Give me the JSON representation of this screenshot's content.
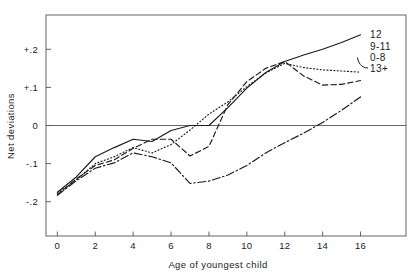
{
  "chart_data": {
    "type": "line",
    "title": "",
    "xlabel": "Age of youngest child",
    "ylabel": "Net deviations",
    "xlim": [
      -0.6,
      18.4
    ],
    "ylim": [
      -0.29,
      0.29
    ],
    "xticks": [
      0,
      2,
      4,
      6,
      8,
      10,
      12,
      14,
      16
    ],
    "xticklabels": [
      "0",
      "2",
      "4",
      "6",
      "8",
      "10",
      "12",
      "14",
      "16"
    ],
    "yticks": [
      0.2,
      0.1,
      0,
      -0.1,
      -0.2
    ],
    "yticklabels": [
      "+.2",
      "+.1",
      "0",
      "-.1",
      "-.2"
    ],
    "grid": false,
    "zero_line": true,
    "legend": "inline-right-end-labels",
    "x": [
      0,
      1,
      2,
      3,
      4,
      5,
      6,
      7,
      8,
      9,
      10,
      11,
      12,
      13,
      14,
      15,
      16
    ],
    "series": [
      {
        "name": "12",
        "label": "12",
        "style": "solid",
        "color": "#1a1a1a",
        "values": [
          -0.175,
          -0.135,
          -0.082,
          -0.058,
          -0.036,
          -0.042,
          -0.013,
          0.0,
          0.0,
          0.047,
          0.098,
          0.139,
          0.168,
          0.185,
          0.2,
          0.218,
          0.238
        ]
      },
      {
        "name": "9-11",
        "label": "9-11",
        "style": "dotted",
        "color": "#1a1a1a",
        "values": [
          -0.178,
          -0.143,
          -0.1,
          -0.082,
          -0.058,
          -0.072,
          -0.05,
          -0.012,
          0.03,
          0.062,
          0.102,
          0.138,
          0.163,
          0.152,
          0.146,
          0.143,
          0.14
        ]
      },
      {
        "name": "0-8",
        "label": "0-8",
        "style": "dashed",
        "color": "#1a1a1a",
        "values": [
          -0.182,
          -0.14,
          -0.105,
          -0.09,
          -0.06,
          -0.036,
          -0.036,
          -0.08,
          -0.055,
          0.055,
          0.115,
          0.15,
          0.168,
          0.13,
          0.106,
          0.108,
          0.118
        ]
      },
      {
        "name": "13+",
        "label": "13+",
        "style": "dashdot",
        "color": "#1a1a1a",
        "values": [
          -0.183,
          -0.145,
          -0.112,
          -0.098,
          -0.072,
          -0.082,
          -0.098,
          -0.152,
          -0.146,
          -0.13,
          -0.105,
          -0.072,
          -0.045,
          -0.02,
          0.008,
          0.04,
          0.075
        ]
      }
    ]
  },
  "axis": {
    "y_title": "Net deviations",
    "x_title": "Age of youngest child"
  }
}
